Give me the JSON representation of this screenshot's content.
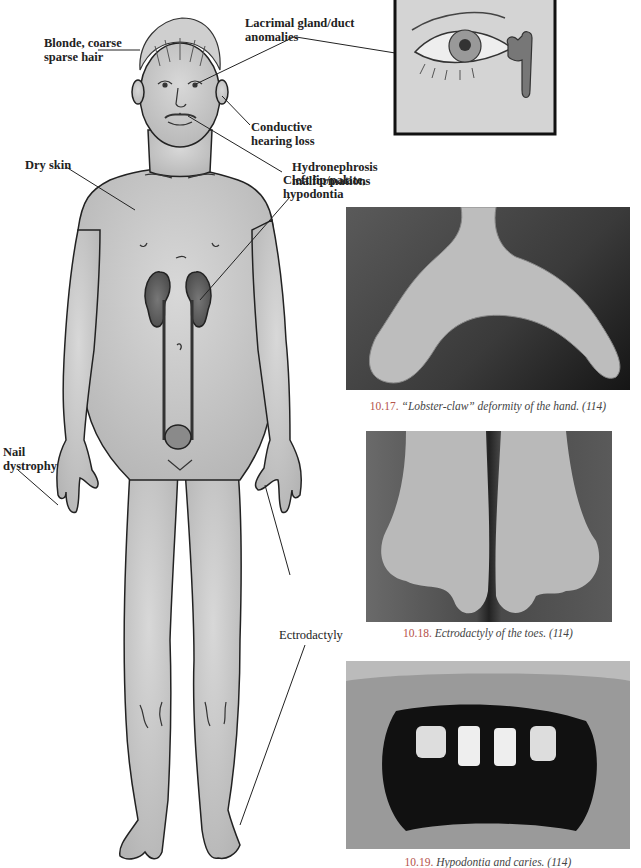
{
  "figure": {
    "labels": {
      "hair": [
        "Blonde, coarse",
        "sparse hair"
      ],
      "lacrimal": [
        "Lacrimal gland/duct",
        "anomalies"
      ],
      "hearing": [
        "Conductive",
        "hearing loss"
      ],
      "dry_skin": "Dry skin",
      "cleft": [
        "Cleft lip/palate,",
        "hypodontia"
      ],
      "hydronephrosis": [
        "Hydronephrosis",
        "malformations"
      ],
      "nail": [
        "Nail",
        "dystrophy"
      ],
      "ectrodactyly": "Ectrodactyly"
    },
    "photos": [
      {
        "number": "10.17.",
        "caption": "“Lobster-claw” deformity of the hand. (114)",
        "subject": "hand"
      },
      {
        "number": "10.18.",
        "caption": "Ectrodactyly of the toes. (114)",
        "subject": "feet"
      },
      {
        "number": "10.19.",
        "caption": "Hypodontia and caries. (114)",
        "subject": "teeth"
      }
    ],
    "inset": {
      "subject": "eye with lacrimal duct"
    }
  }
}
